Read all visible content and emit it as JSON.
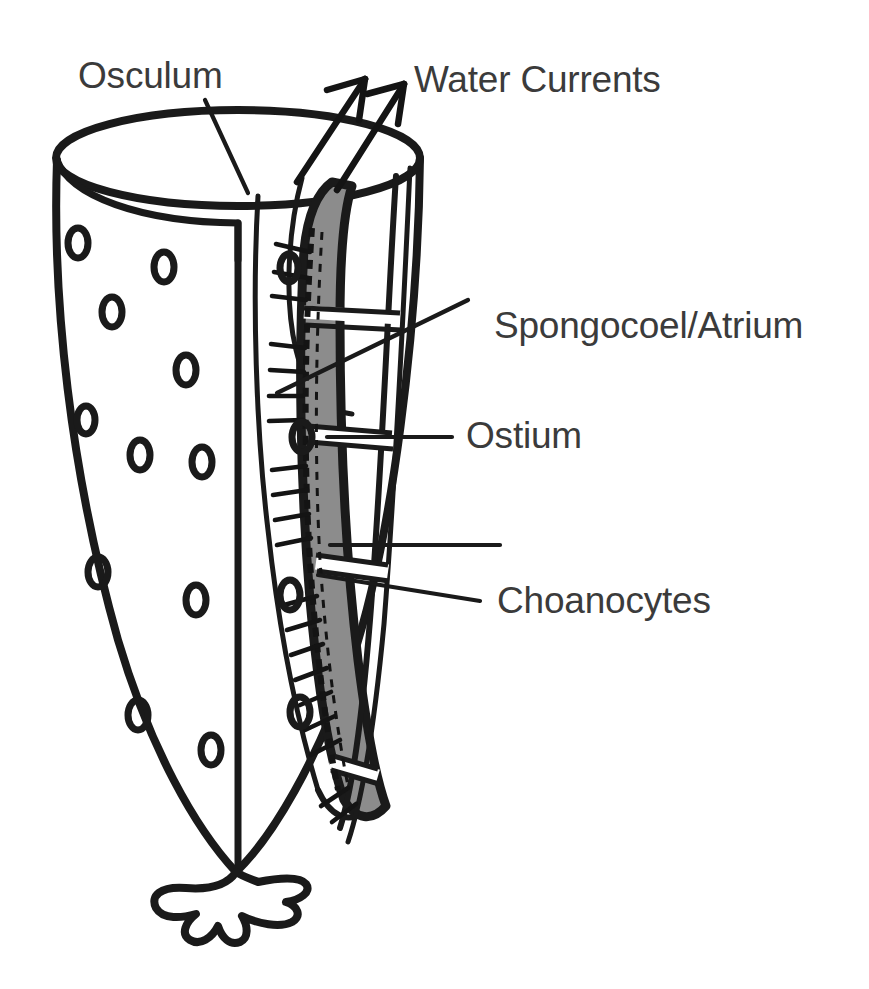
{
  "figure": {
    "background_color": "#ffffff",
    "ink_color": "#1a1a1a",
    "label_color": "#3b3b3b",
    "wall_fill_color": "#8c8c8c",
    "cavity_fill_color": "#ffffff"
  },
  "labels": {
    "osculum": "Osculum",
    "water_currents": "Water Currents",
    "spongocoel": "Spongocoel/Atrium",
    "ostium": "Ostium",
    "choanocytes": "Choanocytes"
  },
  "parts": [
    {
      "name": "osculum",
      "label": "Osculum",
      "label_x": 78,
      "label_y": 88,
      "leader_from": [
        205,
        100
      ],
      "leader_to": [
        248,
        193
      ]
    },
    {
      "name": "water-currents",
      "label": "Water Currents",
      "label_x": 414,
      "label_y": 92,
      "arrows": 2
    },
    {
      "name": "spongocoel",
      "label": "Spongocoel/Atrium",
      "label_x": 494,
      "label_y": 338,
      "leader_from": [
        468,
        300
      ],
      "leader_to": [
        277,
        393
      ]
    },
    {
      "name": "ostium",
      "label": "Ostium",
      "label_x": 466,
      "label_y": 448,
      "leader_from": [
        452,
        437
      ],
      "leader_to": [
        327,
        437
      ]
    },
    {
      "name": "choanocytes",
      "label": "Choanocytes",
      "label_x": 497,
      "label_y": 613,
      "leader_from": [
        480,
        601
      ],
      "leader_to": [
        318,
        575
      ]
    }
  ],
  "structures": {
    "osculum_rim": "elliptical opening at top of sponge body",
    "outer_wall": "body wall bearing ostia pores",
    "spongocoel": "central atrium cavity",
    "wall_cross_section": "gray band showing wall thickness",
    "choanocyte_layer": "dashed cell layer lining the atrium",
    "flagella": "hair-like projections into the atrium",
    "holdfast": "basal root / anchoring structure"
  },
  "ostia_outer_wall": [
    [
      78,
      243
    ],
    [
      164,
      267
    ],
    [
      112,
      312
    ],
    [
      186,
      370
    ],
    [
      86,
      420
    ],
    [
      140,
      455
    ],
    [
      200,
      462
    ],
    [
      98,
      572
    ],
    [
      196,
      600
    ],
    [
      138,
      715
    ],
    [
      211,
      750
    ]
  ],
  "ostia_inner_wall": [
    [
      289,
      268
    ],
    [
      302,
      437
    ],
    [
      290,
      595
    ],
    [
      300,
      712
    ]
  ],
  "wall_ostium_gaps": [
    {
      "y": 318,
      "note": "upper ostium gap"
    },
    {
      "y": 437,
      "note": "labeled ostium gap"
    },
    {
      "y": 566,
      "note": "lower ostium gap"
    },
    {
      "y": 770,
      "note": "basal ostium gap"
    }
  ],
  "arrows": [
    {
      "tail": [
        297,
        182
      ],
      "head": [
        365,
        79
      ]
    },
    {
      "tail": [
        337,
        190
      ],
      "head": [
        404,
        84
      ]
    }
  ]
}
